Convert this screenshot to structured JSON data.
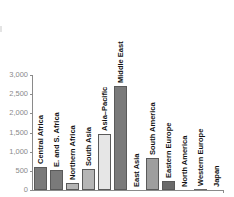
{
  "chart_data": {
    "type": "bar",
    "title": "",
    "xlabel": "",
    "ylabel": "",
    "ylim": [
      0,
      3000
    ],
    "yticks": [
      "0",
      "500",
      "1,000",
      "1,500",
      "2,000",
      "2,500",
      "3,000"
    ],
    "grid": false,
    "legend": null,
    "categories": [
      "Central Africa",
      "E. and S. Africa",
      "Northern Africa",
      "South Asia",
      "Asia–Pacific",
      "Middle East",
      "East Asia",
      "South America",
      "Eastern Europe",
      "North America",
      "Western Europe",
      "Japan"
    ],
    "values": [
      600,
      520,
      180,
      540,
      1460,
      2710,
      0,
      830,
      230,
      0,
      30,
      0
    ],
    "colors": [
      "#7a7a7a",
      "#7a7a7a",
      "#b5b5b5",
      "#b5b5b5",
      "#e6e6e6",
      "#7a7a7a",
      "#7a7a7a",
      "#9e9e9e",
      "#6a6a6a",
      "#6a6a6a",
      "#6a6a6a",
      "#6a6a6a"
    ]
  }
}
